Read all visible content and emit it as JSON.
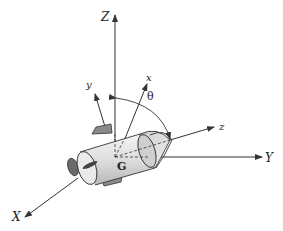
{
  "diagram": {
    "colors": {
      "line": "#333333",
      "body_fill": "#e6e6e6",
      "shade": "#bdbdbd",
      "dark": "#555555"
    },
    "inertial_axes": {
      "X": {
        "label": "X"
      },
      "Y": {
        "label": "Y"
      },
      "Z": {
        "label": "Z"
      }
    },
    "body_axes": {
      "x": {
        "label": "x"
      },
      "y": {
        "label": "y"
      },
      "z": {
        "label": "z"
      }
    },
    "center_of_mass": {
      "label": "G"
    },
    "angle": {
      "label": "θ"
    }
  }
}
